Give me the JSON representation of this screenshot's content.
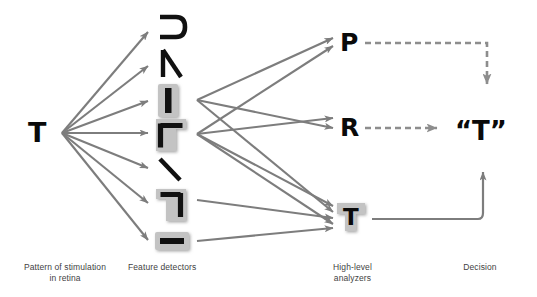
{
  "diagram": {
    "colors": {
      "arrow": "#7d7d7d",
      "dashed": "#8d8d8d",
      "glyph": "#0a0a0a",
      "highlight_box": "#b4b4b4",
      "caption": "#3f3f3f",
      "background": "#ffffff"
    },
    "stages": [
      {
        "id": "retina",
        "caption_line1": "Pattern of stimulation",
        "caption_line2": "in retina"
      },
      {
        "id": "detectors",
        "caption_line1": "Feature detectors",
        "caption_line2": ""
      },
      {
        "id": "analyzers",
        "caption_line1": "High-level",
        "caption_line2": "analyzers"
      },
      {
        "id": "decision",
        "caption_line1": "Decision",
        "caption_line2": ""
      }
    ],
    "stimulus": {
      "label": "T",
      "x": 38,
      "y": 133,
      "size": 26
    },
    "detectors": [
      {
        "id": "arch-left",
        "icon": "curve-open-left",
        "label": "⊃",
        "x": 170,
        "y": 28,
        "highlighted": false
      },
      {
        "id": "diagonal-lambda",
        "icon": "lambda-stroke",
        "label": "Λ",
        "x": 170,
        "y": 62,
        "highlighted": false
      },
      {
        "id": "vertical-bar",
        "icon": "vertical-bar",
        "label": "|",
        "x": 170,
        "y": 100,
        "highlighted": true
      },
      {
        "id": "corner-gamma",
        "icon": "corner-gamma",
        "label": "Γ",
        "x": 170,
        "y": 134,
        "highlighted": true
      },
      {
        "id": "diagonal-back",
        "icon": "backslash",
        "label": "\\",
        "x": 170,
        "y": 170,
        "highlighted": false
      },
      {
        "id": "corner-mirrored",
        "icon": "corner-mirror",
        "label": "¬",
        "x": 170,
        "y": 203,
        "highlighted": true
      },
      {
        "id": "horizontal-bar",
        "icon": "horizontal-bar",
        "label": "—",
        "x": 170,
        "y": 240,
        "highlighted": true
      }
    ],
    "analyzers": [
      {
        "id": "analyzer-p",
        "label": "P",
        "x": 348,
        "y": 43,
        "highlighted": false
      },
      {
        "id": "analyzer-r",
        "label": "R",
        "x": 348,
        "y": 128,
        "highlighted": false
      },
      {
        "id": "analyzer-t",
        "label": "T",
        "x": 350,
        "y": 219,
        "highlighted": true
      }
    ],
    "decision": {
      "label": "“T”",
      "x": 480,
      "y": 131
    },
    "connections": {
      "retina_to_detectors": 7,
      "detectors_to_analyzers": 9,
      "analyzer_to_decision_solid": 1,
      "analyzer_dashed_rejected": 2
    }
  }
}
